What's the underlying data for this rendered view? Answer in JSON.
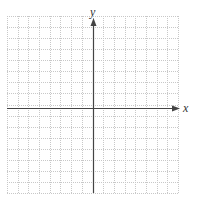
{
  "diagram": {
    "type": "coordinate-plane",
    "grid": {
      "columns": 16,
      "rows": 16,
      "left": 7,
      "top": 16,
      "right": 178,
      "bottom": 193,
      "line_color": "#c8c8c8",
      "line_style": "dotted"
    },
    "axes": {
      "color": "#444444",
      "origin_x": 93,
      "origin_y": 108,
      "x_label": "x",
      "y_label": "y"
    }
  }
}
